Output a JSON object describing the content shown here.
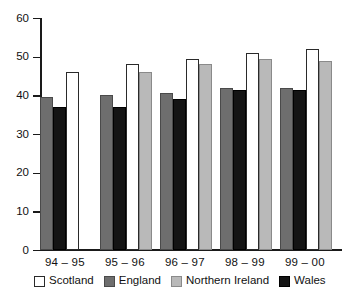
{
  "chart_data": {
    "type": "bar",
    "title": "",
    "subtitle": "",
    "xlabel": "",
    "ylabel": "",
    "ylim": [
      0,
      60
    ],
    "yticks": [
      0,
      10,
      20,
      30,
      40,
      50,
      60
    ],
    "ytick_labels": [
      "0",
      "10",
      "20",
      "30",
      "40",
      "50",
      "60"
    ],
    "grid": false,
    "legend_position": "bottom",
    "categories": [
      "94 – 95",
      "95 – 96",
      "96 – 97",
      "98 – 99",
      "99 – 00"
    ],
    "bar_order": [
      "England",
      "Wales",
      "Scotland",
      "Northern Ireland"
    ],
    "series": [
      {
        "name": "Scotland",
        "color": "#ffffff",
        "values": [
          46.0,
          48.0,
          49.5,
          51.0,
          52.0
        ]
      },
      {
        "name": "England",
        "color": "#6e6e6e",
        "values": [
          39.5,
          40.0,
          40.5,
          42.0,
          42.0
        ]
      },
      {
        "name": "Northern Ireland",
        "color": "#b9b9b9",
        "values": [
          null,
          46.0,
          48.0,
          49.5,
          49.0
        ]
      },
      {
        "name": "Wales",
        "color": "#141414",
        "values": [
          37.0,
          37.0,
          39.0,
          41.5,
          41.5
        ]
      }
    ]
  },
  "legend": {
    "items": [
      {
        "label": "Scotland",
        "key": "scotland"
      },
      {
        "label": "England",
        "key": "england"
      },
      {
        "label": "Northern Ireland",
        "key": "northern-ireland"
      },
      {
        "label": "Wales",
        "key": "wales"
      }
    ]
  }
}
